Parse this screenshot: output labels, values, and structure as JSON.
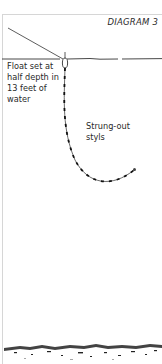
{
  "diagram": {
    "title": "DIAGRAM 3",
    "labels": {
      "float": [
        "Float set at",
        "half depth in",
        "13 feet of",
        "water"
      ],
      "styls": [
        "Strung-out",
        "styls"
      ]
    },
    "elements": [
      "rod line",
      "water surface",
      "float",
      "line with strung-out styls (shot)",
      "hook",
      "river bed"
    ],
    "colors": {
      "line": "#333333",
      "frame": "#d6d6d6",
      "text": "#2a2a2a"
    }
  }
}
